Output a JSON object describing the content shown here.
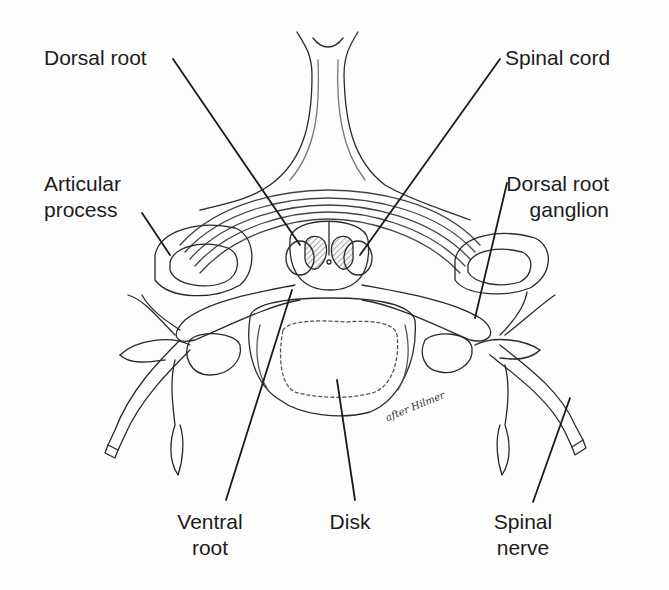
{
  "diagram": {
    "signature": "after Hilmer",
    "labels": {
      "dorsal_root": "Dorsal root",
      "spinal_cord": "Spinal cord",
      "articular_process_l1": "Articular",
      "articular_process_l2": "process",
      "dorsal_root_ganglion_l1": "Dorsal root",
      "dorsal_root_ganglion_l2": "ganglion",
      "ventral_root_l1": "Ventral",
      "ventral_root_l2": "root",
      "disk": "Disk",
      "spinal_nerve_l1": "Spinal",
      "spinal_nerve_l2": "nerve"
    },
    "colors": {
      "ink": "#1c1c1c",
      "background": "#fdfdfd",
      "hatch": "#555555"
    }
  }
}
